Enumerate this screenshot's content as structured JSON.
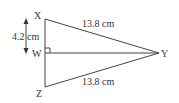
{
  "diagram": {
    "vertices": {
      "X": {
        "label": "X"
      },
      "W": {
        "label": "W"
      },
      "Y": {
        "label": "Y"
      },
      "Z": {
        "label": "Z"
      }
    },
    "measurements": {
      "XY": "13.8 cm",
      "ZY": "13.8 cm",
      "XW": "4.2 cm"
    },
    "right_angle_at": "W",
    "line_color": "#444444"
  }
}
